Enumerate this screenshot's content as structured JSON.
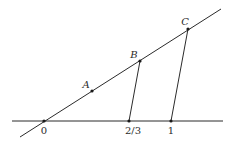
{
  "diagram": {
    "type": "geometric-construction",
    "horizontal_line": {
      "x1": 12,
      "y1": 121,
      "x2": 223,
      "y2": 121
    },
    "oblique_line": {
      "x1": 20,
      "y1": 137,
      "x2": 221,
      "y2": 9
    },
    "axis_points": [
      {
        "id": "zero",
        "label": "0",
        "x": 44,
        "y": 121,
        "label_x": 44,
        "label_y": 134
      },
      {
        "id": "two-thirds",
        "label": "2/3",
        "x": 129,
        "y": 121,
        "label_x": 133,
        "label_y": 134
      },
      {
        "id": "one",
        "label": "1",
        "x": 171,
        "y": 121,
        "label_x": 171,
        "label_y": 134
      }
    ],
    "ray_points": [
      {
        "id": "A",
        "label": "A",
        "x": 92,
        "y": 91,
        "label_x": 86,
        "label_y": 88
      },
      {
        "id": "B",
        "label": "B",
        "x": 140,
        "y": 61,
        "label_x": 134,
        "label_y": 58
      },
      {
        "id": "C",
        "label": "C",
        "x": 188,
        "y": 29,
        "label_x": 185,
        "label_y": 25
      }
    ],
    "segments": [
      {
        "id": "B-to-two-thirds",
        "from": "B",
        "to": "2/3",
        "x1": 140,
        "y1": 61,
        "x2": 129,
        "y2": 121
      },
      {
        "id": "C-to-one",
        "from": "C",
        "to": "1",
        "x1": 188,
        "y1": 29,
        "x2": 171,
        "y2": 121
      }
    ]
  }
}
